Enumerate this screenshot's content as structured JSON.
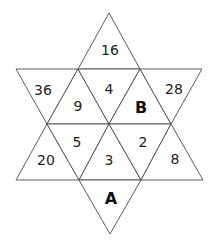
{
  "diagram": {
    "type": "hexagram-of-triangles",
    "cells": [
      {
        "position": "top-point",
        "value": "16"
      },
      {
        "position": "upper-left-point",
        "value": "36"
      },
      {
        "position": "upper-left-inner",
        "value": "9"
      },
      {
        "position": "upper-center-inner",
        "value": "4"
      },
      {
        "position": "upper-right-inner",
        "value": "B"
      },
      {
        "position": "upper-right-point",
        "value": "28"
      },
      {
        "position": "lower-left-point",
        "value": "20"
      },
      {
        "position": "lower-left-inner",
        "value": "5"
      },
      {
        "position": "lower-center-inner",
        "value": "3"
      },
      {
        "position": "lower-right-inner",
        "value": "2"
      },
      {
        "position": "lower-right-point",
        "value": "8"
      },
      {
        "position": "bottom-point",
        "value": "A"
      }
    ],
    "unknowns": [
      "A",
      "B"
    ]
  }
}
